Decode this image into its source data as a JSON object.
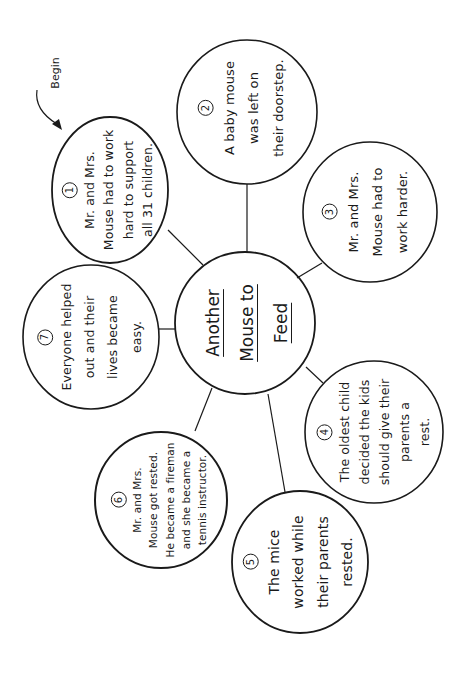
{
  "title": "Another Mouse to Feed",
  "center": {
    "lines": [
      "Another",
      "Mouse to",
      "Feed"
    ],
    "cx": 245,
    "cy": 323,
    "rx": 70,
    "ry": 71
  },
  "start_marker": {
    "label": "Begin"
  },
  "bubbles": [
    {
      "number": "1",
      "lines": [
        "Mr. and Mrs.",
        "Mouse had to work",
        "hard to support",
        "all 31 children."
      ],
      "cx": 110,
      "cy": 190,
      "rx": 58,
      "ry": 73
    },
    {
      "number": "2",
      "lines": [
        "A baby mouse",
        "was left on",
        "their doorstep."
      ],
      "cx": 247,
      "cy": 112,
      "rx": 70,
      "ry": 72
    },
    {
      "number": "3",
      "lines": [
        "Mr. and Mrs.",
        "Mouse had to",
        "work harder."
      ],
      "cx": 370,
      "cy": 212,
      "rx": 67,
      "ry": 70
    },
    {
      "number": "4",
      "lines": [
        "The oldest child",
        "decided the kids",
        "should give their",
        "parents a",
        "rest."
      ],
      "cx": 374,
      "cy": 432,
      "rx": 69,
      "ry": 71
    },
    {
      "number": "5",
      "lines": [
        "The mice",
        "worked while",
        "their parents",
        "rested."
      ],
      "cx": 300,
      "cy": 562,
      "rx": 68,
      "ry": 71
    },
    {
      "number": "6",
      "lines": [
        "Mr. and Mrs.",
        "Mouse got rested.",
        "He became a fireman",
        "and she became a",
        "tennis instructor."
      ],
      "cx": 161,
      "cy": 500,
      "rx": 66,
      "ry": 68
    },
    {
      "number": "7",
      "lines": [
        "Everyone helped",
        "out and their",
        "lives became",
        "easy."
      ],
      "cx": 91,
      "cy": 337,
      "rx": 68,
      "ry": 72
    }
  ],
  "colors": {
    "ink": "#1a1a1a",
    "paper": "#ffffff"
  }
}
